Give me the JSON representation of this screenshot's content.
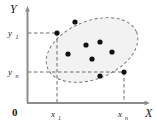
{
  "figure": {
    "background_color": "#ffffff"
  },
  "axes": {
    "x_axis_label": "X",
    "y_axis_label": "Y",
    "origin_label": "0",
    "axis_color": "#8c8c8c",
    "label_color": "#1a1a1a"
  },
  "ticks": {
    "y_upper": {
      "base": "y",
      "sub": "1",
      "text": "y1"
    },
    "y_lower": {
      "base": "y",
      "sub": "n",
      "text": "yn"
    },
    "x_left": {
      "base": "x",
      "sub": "1",
      "text": "x1"
    },
    "x_right": {
      "base": "x",
      "sub": "n",
      "text": "xn"
    }
  },
  "ellipse": {
    "fill_color": "#f2f2f2",
    "stroke_color": "#6e6e6e",
    "dash": "3,2.5",
    "cx": 92,
    "cy": 50,
    "rx": 48,
    "ry": 29,
    "rotation_deg": -22
  },
  "guides": {
    "stroke_color": "#5a5a5a",
    "dash": "3.5,2.5"
  },
  "chart_data": {
    "type": "scatter",
    "xlabel": "X",
    "ylabel": "Y",
    "grid": false,
    "legend": false,
    "point_color": "#111111",
    "point_radius": 2.6,
    "xticks": [
      "x1",
      "xn"
    ],
    "yticks": [
      "y1",
      "yn"
    ],
    "xtick_px": [
      57,
      124
    ],
    "ytick_px": [
      33,
      72
    ],
    "points_px": [
      {
        "x": 57,
        "y": 33,
        "label": "(x1, y1)"
      },
      {
        "x": 75,
        "y": 22,
        "label": ""
      },
      {
        "x": 86,
        "y": 45,
        "label": ""
      },
      {
        "x": 100,
        "y": 42,
        "label": ""
      },
      {
        "x": 68,
        "y": 54,
        "label": ""
      },
      {
        "x": 92,
        "y": 59,
        "label": ""
      },
      {
        "x": 112,
        "y": 52,
        "label": ""
      },
      {
        "x": 100,
        "y": 76,
        "label": ""
      },
      {
        "x": 124,
        "y": 72,
        "label": "(xn, yn)"
      }
    ]
  }
}
